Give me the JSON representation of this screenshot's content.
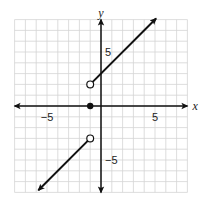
{
  "chart_data": {
    "type": "line",
    "title": "",
    "xlabel": "x",
    "ylabel": "y",
    "xlim": [
      -8,
      8
    ],
    "ylim": [
      -8,
      8
    ],
    "grid": true,
    "tick_labels": {
      "x": [
        {
          "value": -5,
          "label": "−5"
        },
        {
          "value": 5,
          "label": "5"
        }
      ],
      "y": [
        {
          "value": 5,
          "label": "5"
        },
        {
          "value": -5,
          "label": "−5"
        }
      ]
    },
    "series": [
      {
        "name": "upper-piece",
        "equation": "y = x + 3, x > -1",
        "start": {
          "x": -1,
          "y": 2,
          "endpoint": "open"
        },
        "end": {
          "x": 5.1,
          "y": 8.1,
          "endpoint": "arrow"
        }
      },
      {
        "name": "lower-piece",
        "equation": "y = x - 2, x < -1",
        "start": {
          "x": -1,
          "y": -3,
          "endpoint": "open"
        },
        "end": {
          "x": -5.8,
          "y": -7.8,
          "endpoint": "arrow"
        }
      }
    ],
    "points": [
      {
        "x": -1,
        "y": 0,
        "style": "closed"
      }
    ],
    "legend": null
  },
  "layout": {
    "origin_px": [
      101,
      106
    ],
    "unit_px": 10.8,
    "colors": {
      "grid": "#d4d4d4",
      "axis": "#111111",
      "curve": "#111111",
      "background": "#ffffff"
    }
  }
}
